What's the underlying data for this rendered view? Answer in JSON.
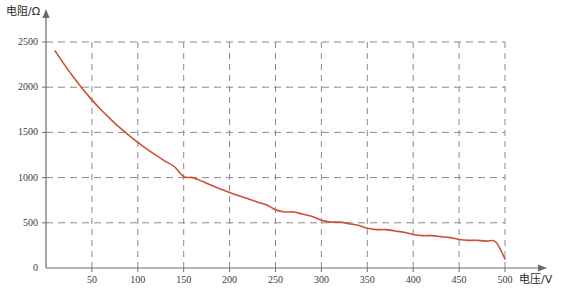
{
  "chart_data": {
    "type": "line",
    "title": "",
    "xlabel": "电压/V",
    "ylabel": "电阻/Ω",
    "xlim": [
      0,
      500
    ],
    "ylim": [
      0,
      2500
    ],
    "xticks": [
      0,
      50,
      100,
      150,
      200,
      250,
      300,
      350,
      400,
      450,
      500
    ],
    "yticks": [
      0,
      500,
      1000,
      1500,
      2000,
      2500
    ],
    "grid": true,
    "grid_style": "dashed",
    "legend": "none",
    "series": [
      {
        "name": "电阻-电压曲线",
        "color": "#cc5033",
        "x": [
          10,
          20,
          30,
          40,
          50,
          60,
          70,
          80,
          90,
          100,
          110,
          120,
          130,
          140,
          150,
          160,
          170,
          180,
          190,
          200,
          210,
          220,
          230,
          240,
          250,
          260,
          270,
          280,
          290,
          300,
          310,
          320,
          330,
          340,
          350,
          360,
          370,
          380,
          390,
          400,
          410,
          420,
          430,
          440,
          450,
          460,
          470,
          480,
          490,
          500
        ],
        "y": [
          2400,
          2250,
          2110,
          1980,
          1860,
          1750,
          1650,
          1555,
          1470,
          1390,
          1315,
          1245,
          1180,
          1120,
          1000,
          1010,
          960,
          915,
          875,
          835,
          800,
          765,
          730,
          700,
          600,
          645,
          620,
          595,
          570,
          450,
          528,
          508,
          490,
          472,
          380,
          440,
          425,
          410,
          396,
          310,
          370,
          358,
          347,
          336,
          230,
          316,
          306,
          297,
          288,
          100
        ]
      }
    ]
  },
  "axes": {
    "y_title": "电阻/Ω",
    "x_title": "电压/V",
    "y_tick_labels": [
      "2500",
      "2000",
      "1500",
      "1000",
      "500",
      "0"
    ],
    "x_tick_labels": [
      "50",
      "100",
      "150",
      "200",
      "250",
      "300",
      "350",
      "400",
      "450",
      "500"
    ],
    "origin_label": "0"
  },
  "colors": {
    "curve": "#cc5033",
    "axis": "#6b6b6b",
    "grid": "#8a8a8a",
    "text": "#3a3a3a"
  }
}
